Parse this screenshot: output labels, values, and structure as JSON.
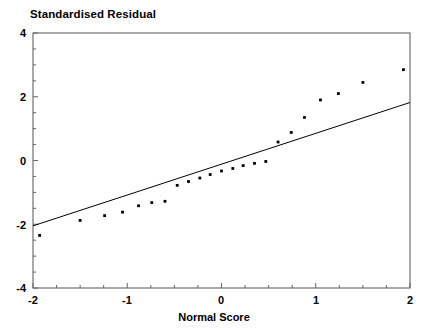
{
  "chart_data": {
    "type": "scatter",
    "title": "",
    "xlabel": "Normal Score",
    "ylabel": "Standardised Residual",
    "xlim": [
      -2,
      2
    ],
    "ylim": [
      -4,
      4
    ],
    "xticks": [
      -2,
      -1,
      0,
      1,
      2
    ],
    "yticks": [
      -4,
      -2,
      0,
      2,
      4
    ],
    "xtick_labels": [
      "-2",
      "-1",
      "0",
      "1",
      "2"
    ],
    "ytick_labels": [
      "-4",
      "-2",
      "0",
      "2",
      "4"
    ],
    "grid": false,
    "legend": "none",
    "frame": true,
    "minor_ticks": true,
    "series": [
      {
        "name": "residuals",
        "marker": "dot",
        "color": "#000000",
        "x": [
          -1.93,
          -1.5,
          -1.24,
          -1.05,
          -0.88,
          -0.74,
          -0.6,
          -0.47,
          -0.35,
          -0.23,
          -0.12,
          0.0,
          0.12,
          0.23,
          0.35,
          0.47,
          0.6,
          0.74,
          0.88,
          1.05,
          1.24,
          1.5,
          1.93
        ],
        "y": [
          -2.35,
          -1.88,
          -1.73,
          -1.62,
          -1.42,
          -1.32,
          -1.28,
          -0.78,
          -0.66,
          -0.55,
          -0.44,
          -0.33,
          -0.25,
          -0.16,
          -0.09,
          -0.03,
          0.58,
          0.88,
          1.35,
          1.9,
          2.1,
          2.45,
          2.85
        ]
      },
      {
        "name": "reference-line",
        "type": "line",
        "color": "#000000",
        "x": [
          -2,
          2
        ],
        "y": [
          -2.05,
          1.82
        ]
      }
    ]
  },
  "axes": {
    "y_title": "Standardised Residual",
    "x_title": "Normal Score"
  }
}
